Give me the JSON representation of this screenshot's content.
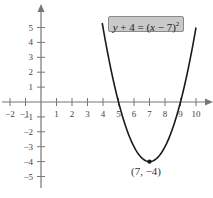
{
  "chart_data": {
    "type": "line",
    "title": "",
    "equation": "y + 4 = (x − 7)²",
    "equation_parts": {
      "lhs_var": "y",
      "lhs_rest": " + 4 = (",
      "x_var": "x",
      "rhs_rest": " − 7)",
      "exponent": "2"
    },
    "function": "y = (x - 7)^2 - 4",
    "xlabel": "",
    "ylabel": "",
    "xlim": [
      -2.5,
      10.8
    ],
    "ylim": [
      -6,
      6.5
    ],
    "x_ticks": [
      -2,
      -1,
      1,
      2,
      3,
      4,
      5,
      6,
      7,
      8,
      9,
      10
    ],
    "x_tick_labels": [
      "−2",
      "−1",
      "1",
      "2",
      "3",
      "4",
      "5",
      "6",
      "7",
      "8",
      "9",
      "10"
    ],
    "y_ticks": [
      5,
      4,
      3,
      2,
      1,
      -1,
      -2,
      -3,
      -4,
      -5
    ],
    "y_tick_labels": [
      "5",
      "4",
      "3",
      "2",
      "1",
      "−1",
      "−2",
      "−3",
      "−4",
      "−5"
    ],
    "grid": false,
    "series": [
      {
        "name": "parabola",
        "x": [
          4.3,
          5,
          6,
          7,
          8,
          9,
          9.7
        ],
        "y": [
          3.29,
          0,
          -3,
          -4,
          -3,
          0,
          3.29
        ]
      }
    ],
    "annotations": [
      {
        "text": "(7, −4)",
        "x": 7,
        "y": -4,
        "marker": "point"
      }
    ],
    "x_intercepts": [
      5,
      9
    ],
    "vertex": [
      7,
      -4
    ]
  }
}
